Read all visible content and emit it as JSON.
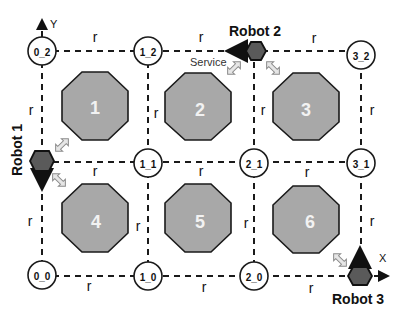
{
  "diagram": {
    "edge_label": "r",
    "nodes": [
      {
        "id": "0_2",
        "label": "0_2"
      },
      {
        "id": "1_2",
        "label": "1_2"
      },
      {
        "id": "3_2",
        "label": "3_2"
      },
      {
        "id": "1_1",
        "label": "1_1"
      },
      {
        "id": "2_1",
        "label": "2_1"
      },
      {
        "id": "3_1",
        "label": "3_1"
      },
      {
        "id": "0_0",
        "label": "0_0"
      },
      {
        "id": "1_0",
        "label": "1_0"
      },
      {
        "id": "2_0",
        "label": "2_0"
      }
    ],
    "obstacles": [
      {
        "label": "1"
      },
      {
        "label": "2"
      },
      {
        "label": "3"
      },
      {
        "label": "4"
      },
      {
        "label": "5"
      },
      {
        "label": "6"
      }
    ],
    "robots": [
      {
        "label": "Robot 1",
        "at": "0_1",
        "heading": "down"
      },
      {
        "label": "Robot 2",
        "at": "2_2",
        "heading": "left"
      },
      {
        "label": "Robot 3",
        "at": "3_0",
        "heading": "up"
      }
    ],
    "axes": {
      "x": "X",
      "y": "Y"
    },
    "service_label": "Service",
    "colors": {
      "obstacle": "#a8a8a8",
      "robot": "#5a5a5a",
      "line": "#1a1a1a"
    }
  }
}
